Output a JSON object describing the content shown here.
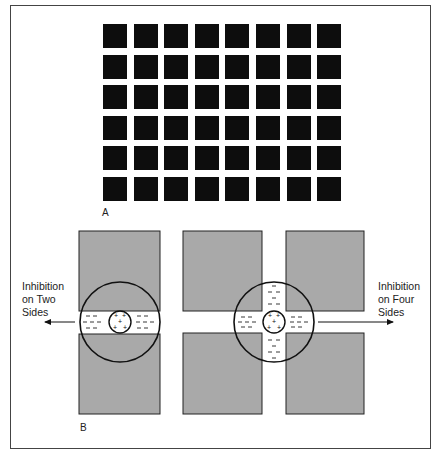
{
  "figure": {
    "panel_a": {
      "label": "A",
      "grid": {
        "rows": 6,
        "cols": 8,
        "square_color": "#0d0d0d",
        "background": "#ffffff"
      }
    },
    "panel_b": {
      "label": "B",
      "left_annotation": [
        "Inhibition",
        "on Two",
        "Sides"
      ],
      "right_annotation": [
        "Inhibition",
        "on Four",
        "Sides"
      ],
      "center_sign": "+",
      "surround_sign": "−",
      "block_color": "#a9a9a9"
    }
  }
}
